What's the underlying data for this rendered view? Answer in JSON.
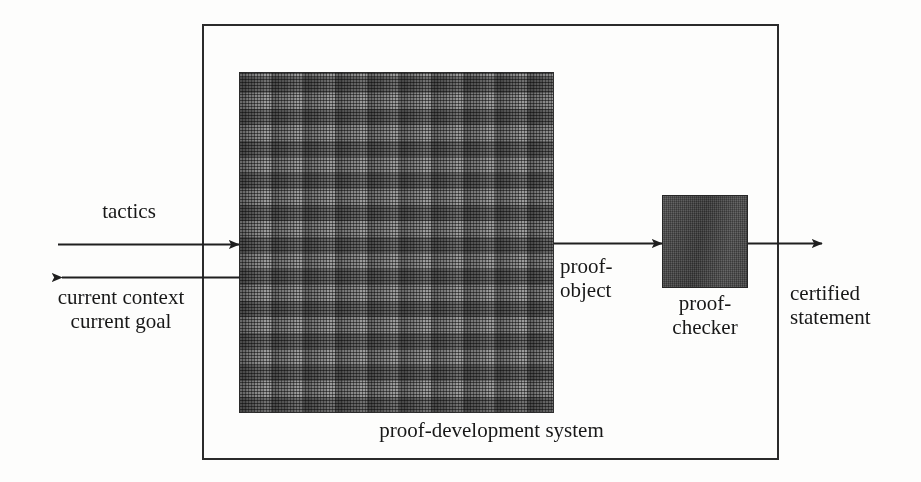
{
  "diagram": {
    "background_color": "#fdfdfc",
    "line_color": "#1f1f1f",
    "boxes": {
      "outer_system": {
        "name": "proof-development system boundary",
        "caption": "proof-development system",
        "fill": "none",
        "stroke": "#2b2b2b"
      },
      "engine": {
        "name": "proof engine",
        "fill": "#585858",
        "pattern": "basket-weave hatch"
      },
      "checker": {
        "name": "proof checker",
        "label_line1": "proof-",
        "label_line2": "checker",
        "fill": "#4e4e4e",
        "pattern": "solid noisy gray"
      }
    },
    "labels": {
      "tactics": "tactics",
      "current_context": "current context",
      "current_goal": "current goal",
      "proof_object_line1": "proof-",
      "proof_object_line2": "object",
      "certified_line1": "certified",
      "certified_line2": "statement",
      "system_caption": "proof-development system"
    },
    "arrows": [
      {
        "name": "tactics-input-arrow",
        "from": "user",
        "to": "proof-development system",
        "direction": "right",
        "label": "tactics"
      },
      {
        "name": "context-goal-output-arrow",
        "from": "proof-development system",
        "to": "user",
        "direction": "left",
        "label": "current context / current goal"
      },
      {
        "name": "proof-object-arrow",
        "from": "proof engine",
        "to": "proof-checker",
        "direction": "right",
        "label": "proof-object"
      },
      {
        "name": "certified-statement-arrow",
        "from": "proof-checker",
        "to": "output",
        "direction": "right",
        "label": "certified statement"
      }
    ]
  }
}
